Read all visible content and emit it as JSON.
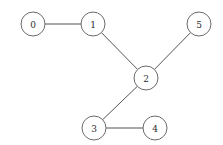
{
  "diagram": {
    "width": 223,
    "height": 145,
    "background_color": "#ffffff",
    "node_radius": 12,
    "node_fill_color": "#ffffff",
    "node_stroke_color": "#6a6a6a",
    "edge_color": "#555555",
    "label_color": "#2b2b2b",
    "nodes": [
      {
        "id": "0",
        "label": "0",
        "cx": 33,
        "cy": 24
      },
      {
        "id": "1",
        "label": "1",
        "cx": 93,
        "cy": 24
      },
      {
        "id": "2",
        "label": "2",
        "cx": 146,
        "cy": 78
      },
      {
        "id": "3",
        "label": "3",
        "cx": 94,
        "cy": 128
      },
      {
        "id": "4",
        "label": "4",
        "cx": 155,
        "cy": 128
      },
      {
        "id": "5",
        "label": "5",
        "cx": 199,
        "cy": 24
      }
    ],
    "edges": [
      {
        "source": "0",
        "target": "1"
      },
      {
        "source": "1",
        "target": "2"
      },
      {
        "source": "2",
        "target": "5"
      },
      {
        "source": "2",
        "target": "3"
      },
      {
        "source": "3",
        "target": "4"
      }
    ]
  }
}
